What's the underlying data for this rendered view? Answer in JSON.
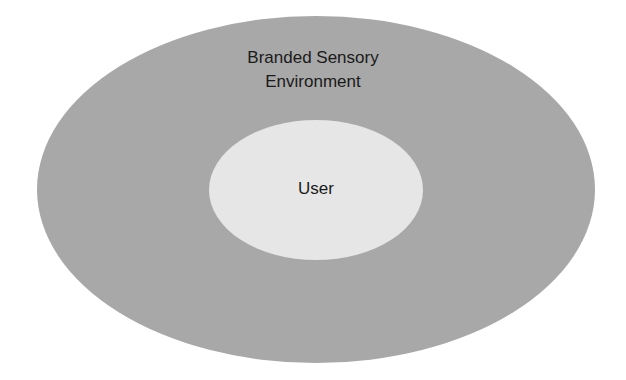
{
  "diagram": {
    "outer": {
      "label_line1": "Branded Sensory",
      "label_line2": "Environment",
      "color": "#a8a8a8"
    },
    "inner": {
      "label": "User",
      "color": "#e6e6e6"
    }
  }
}
